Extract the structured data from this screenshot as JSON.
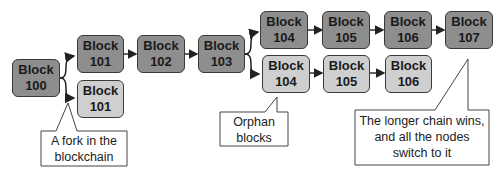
{
  "diagram": {
    "colors": {
      "main_chain": "#8e8e8e",
      "orphan_chain": "#cfcfcf",
      "border": "#3a3a3a"
    },
    "blocks": [
      {
        "id": "b100",
        "label": "Block",
        "number": "100",
        "chain": "main"
      },
      {
        "id": "b101a",
        "label": "Block",
        "number": "101",
        "chain": "main"
      },
      {
        "id": "b101b",
        "label": "Block",
        "number": "101",
        "chain": "orphan"
      },
      {
        "id": "b102",
        "label": "Block",
        "number": "102",
        "chain": "main"
      },
      {
        "id": "b103",
        "label": "Block",
        "number": "103",
        "chain": "main"
      },
      {
        "id": "b104a",
        "label": "Block",
        "number": "104",
        "chain": "main"
      },
      {
        "id": "b105a",
        "label": "Block",
        "number": "105",
        "chain": "main"
      },
      {
        "id": "b106a",
        "label": "Block",
        "number": "106",
        "chain": "main"
      },
      {
        "id": "b107",
        "label": "Block",
        "number": "107",
        "chain": "main"
      },
      {
        "id": "b104b",
        "label": "Block",
        "number": "104",
        "chain": "orphan"
      },
      {
        "id": "b105b",
        "label": "Block",
        "number": "105",
        "chain": "orphan"
      },
      {
        "id": "b106b",
        "label": "Block",
        "number": "106",
        "chain": "orphan"
      }
    ],
    "callouts": [
      {
        "id": "fork",
        "line1": "A fork in the",
        "line2": "blockchain"
      },
      {
        "id": "orphan",
        "line1": "Orphan",
        "line2": "blocks"
      },
      {
        "id": "longer",
        "line1": "The longer chain wins,",
        "line2": "and all the nodes",
        "line3": "switch to it"
      }
    ]
  }
}
